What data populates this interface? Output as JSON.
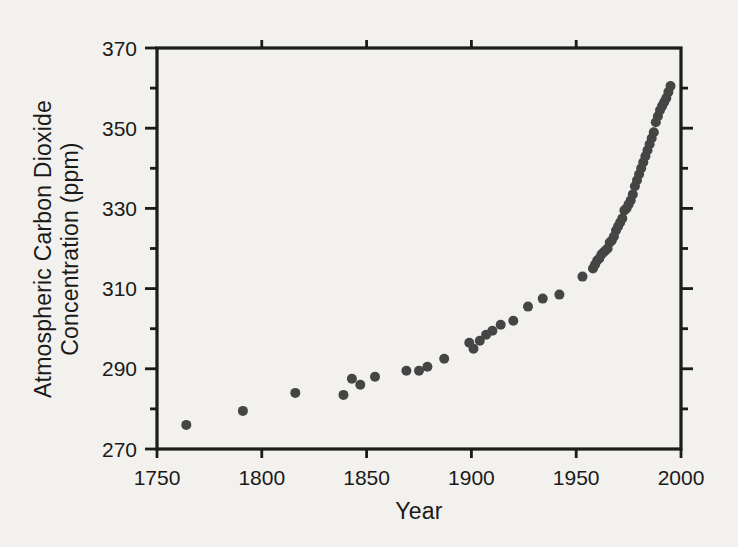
{
  "figure": {
    "background_color": "#f2f1ee",
    "ink_color": "#1a1a1a"
  },
  "chart_data": {
    "type": "scatter",
    "title": "",
    "xlabel": "Year",
    "ylabel_line1": "Atmospheric Carbon Dioxide",
    "ylabel_line2": "Concentration (ppm)",
    "xlim": [
      1750,
      2000
    ],
    "ylim": [
      270,
      370
    ],
    "grid": false,
    "legend": null,
    "x_major_ticks": [
      1750,
      1800,
      1850,
      1900,
      1950,
      2000
    ],
    "x_top_ticks": [
      1800,
      1850,
      1900,
      1950
    ],
    "y_major_ticks": [
      270,
      290,
      310,
      330,
      350,
      370
    ],
    "y_minor_ticks": [
      280,
      300,
      320,
      340,
      360
    ],
    "y_right_major_ticks": [
      290,
      310,
      330,
      350
    ],
    "y_right_minor_ticks": [
      280,
      300,
      320,
      340,
      360
    ],
    "marker": {
      "shape": "circle",
      "diameter_px": 10,
      "color": "#454545"
    },
    "series": [
      {
        "points": [
          [
            1764,
            276
          ],
          [
            1791,
            279.5
          ],
          [
            1816,
            284
          ],
          [
            1839,
            283.5
          ],
          [
            1843,
            287.5
          ],
          [
            1847,
            286
          ],
          [
            1854,
            288
          ],
          [
            1869,
            289.5
          ],
          [
            1875,
            289.5
          ],
          [
            1879,
            290.5
          ],
          [
            1887,
            292.5
          ],
          [
            1899,
            296.5
          ],
          [
            1901,
            295
          ],
          [
            1904,
            297
          ],
          [
            1907,
            298.5
          ],
          [
            1910,
            299.5
          ],
          [
            1914,
            301
          ],
          [
            1920,
            302
          ],
          [
            1927,
            305.5
          ],
          [
            1934,
            307.5
          ],
          [
            1942,
            308.5
          ],
          [
            1953,
            313
          ],
          [
            1958,
            315
          ],
          [
            1959,
            316
          ],
          [
            1960,
            317
          ],
          [
            1961,
            317.5
          ],
          [
            1962,
            318.5
          ],
          [
            1963,
            319
          ],
          [
            1964,
            319.5
          ],
          [
            1965,
            320
          ],
          [
            1966,
            321.5
          ],
          [
            1967,
            322
          ],
          [
            1968,
            323
          ],
          [
            1969,
            324.5
          ],
          [
            1970,
            325.5
          ],
          [
            1971,
            326.5
          ],
          [
            1972,
            327.5
          ],
          [
            1973,
            329.5
          ],
          [
            1974,
            330
          ],
          [
            1975,
            331
          ],
          [
            1976,
            332
          ],
          [
            1977,
            333.5
          ],
          [
            1978,
            335.5
          ],
          [
            1979,
            337
          ],
          [
            1980,
            338.5
          ],
          [
            1981,
            340
          ],
          [
            1982,
            341.5
          ],
          [
            1983,
            343
          ],
          [
            1984,
            344.5
          ],
          [
            1985,
            346
          ],
          [
            1986,
            347.5
          ],
          [
            1987,
            349
          ],
          [
            1988,
            351.5
          ],
          [
            1989,
            353
          ],
          [
            1990,
            354.5
          ],
          [
            1991,
            355.5
          ],
          [
            1992,
            356.5
          ],
          [
            1993,
            357.5
          ],
          [
            1994,
            359
          ],
          [
            1995,
            360.5
          ]
        ]
      }
    ]
  }
}
